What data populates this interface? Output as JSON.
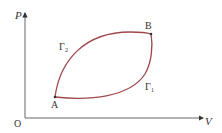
{
  "diagram": {
    "axes": {
      "y_label": "P",
      "x_label": "V",
      "origin_label": "O"
    },
    "points": [
      {
        "name": "A",
        "label": "A"
      },
      {
        "name": "B",
        "label": "B"
      }
    ],
    "curves": [
      {
        "name": "gamma-2",
        "label": "Γ₂",
        "path": "upper"
      },
      {
        "name": "gamma-1",
        "label": "Γ₁",
        "path": "lower"
      }
    ],
    "colors": {
      "axis": "#555555",
      "curve": "#a0484c",
      "text": "#333333"
    }
  }
}
